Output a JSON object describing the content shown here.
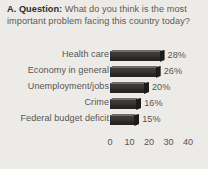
{
  "question": {
    "label": "A. Question:",
    "text": " What do you think is the most important problem facing this country today?"
  },
  "chart_data": {
    "type": "bar",
    "orientation": "horizontal",
    "title": "",
    "xlabel": "",
    "ylabel": "",
    "categories": [
      "Health care",
      "Economy in general",
      "Unemployment/jobs",
      "Crime",
      "Federal budget deficit"
    ],
    "values": [
      28,
      26,
      20,
      16,
      15
    ],
    "data_labels": [
      "28%",
      "26%",
      "20%",
      "16%",
      "15%"
    ],
    "xlim": [
      0,
      40
    ],
    "xticks": [
      0,
      10,
      20,
      30,
      40
    ],
    "xtick_labels": [
      "0",
      "10",
      "20",
      "30",
      "40"
    ],
    "grid": false,
    "legend": false,
    "bar_color": "#343231",
    "background_color": "#edebe7"
  }
}
